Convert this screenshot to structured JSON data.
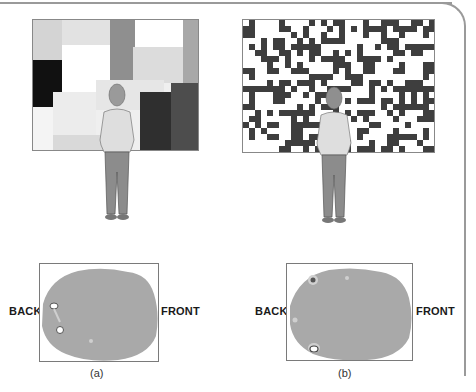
{
  "figure": {
    "panels": [
      {
        "id": "a",
        "caption": "(a)",
        "stimulus": "mondrian-pattern",
        "back_label": "BACK",
        "front_label": "FRONT"
      },
      {
        "id": "b",
        "caption": "(b)",
        "stimulus": "random-checkerboard",
        "back_label": "BACK",
        "front_label": "FRONT"
      }
    ],
    "colors": {
      "frame": "#9a9a9a",
      "brain_fill": "#a9a9a9",
      "checker_dark": "#3e3e3e",
      "person_shirt": "#dedede",
      "person_pants": "#8c8c8c"
    }
  }
}
